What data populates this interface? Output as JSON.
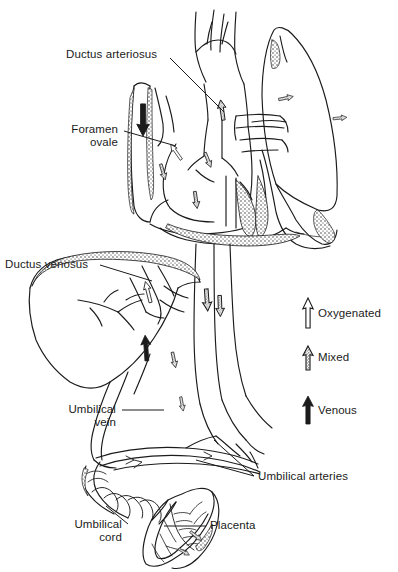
{
  "figure": {
    "background_color": "#ffffff",
    "ink_color": "#1b1b1b"
  },
  "labels": {
    "ductus_arteriosus": "Ductus arteriosus",
    "foramen_ovale": "Foramen\novale",
    "ductus_venosus": "Ductus venosus",
    "umbilical_vein": "Umbilical\nvein",
    "umbilical_cord": "Umbilical\ncord",
    "placenta": "Placenta",
    "umbilical_arteries": "Umbilical arteries"
  },
  "legend": {
    "items": [
      {
        "label": "Oxygenated",
        "symbol": "arrow-outline-up",
        "fill": "#ffffff",
        "stroke": "#1b1b1b"
      },
      {
        "label": "Mixed",
        "symbol": "arrow-stippled-up",
        "fill": "#ffffff",
        "stroke": "#1b1b1b"
      },
      {
        "label": "Venous",
        "symbol": "arrow-solid-up",
        "fill": "#1b1b1b",
        "stroke": "#1b1b1b"
      }
    ]
  },
  "anatomy": {
    "structures": [
      "heart",
      "lung",
      "aortic-arch",
      "ductus-arteriosus-vessel",
      "superior-vena-cava",
      "descending-aorta",
      "inferior-vena-cava",
      "liver",
      "ductus-venosus-vessel",
      "umbilical-vein-vessel",
      "umbilical-arteries-vessels",
      "umbilical-cord",
      "placenta"
    ],
    "flow_arrows": [
      {
        "name": "ductus-arteriosus-flow",
        "type": "venous"
      },
      {
        "name": "foramen-ovale-flow",
        "type": "oxygenated"
      },
      {
        "name": "aortic-arch-flow",
        "type": "mixed"
      },
      {
        "name": "pulmonary-flow",
        "type": "mixed"
      },
      {
        "name": "left-ventricle-flow",
        "type": "mixed"
      },
      {
        "name": "descending-aorta-flow",
        "type": "mixed"
      },
      {
        "name": "ductus-venosus-flow",
        "type": "oxygenated"
      },
      {
        "name": "umbilical-vein-flow",
        "type": "venous"
      },
      {
        "name": "umbilical-artery-flow",
        "type": "mixed"
      },
      {
        "name": "placenta-flow",
        "type": "mixed"
      }
    ]
  }
}
